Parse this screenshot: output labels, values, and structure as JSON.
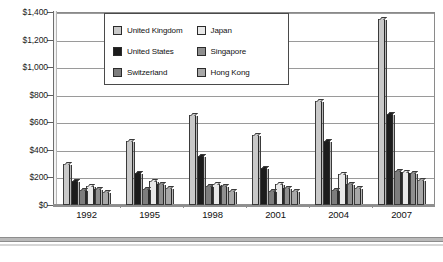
{
  "chart_data": {
    "type": "bar",
    "title": "",
    "xlabel": "",
    "ylabel": "",
    "categories": [
      "1992",
      "1995",
      "1998",
      "2001",
      "2004",
      "2007"
    ],
    "ylim": [
      0,
      1400
    ],
    "ytick_values": [
      0,
      200,
      400,
      600,
      800,
      1000,
      1200,
      1400
    ],
    "ytick_labels": [
      "$0",
      "$200",
      "$400",
      "$600",
      "$800",
      "$1,000",
      "$1,200",
      "$1,400"
    ],
    "grid": true,
    "legend_position": "top-center-overlay",
    "series": [
      {
        "name": "United Kingdom",
        "color": "#c9c9c9",
        "values": [
          300,
          465,
          650,
          505,
          755,
          1350
        ]
      },
      {
        "name": "United States",
        "color": "#1c1c1c",
        "values": [
          175,
          230,
          355,
          265,
          465,
          660
        ]
      },
      {
        "name": "Switzerland",
        "color": "#7d7d7d",
        "values": [
          110,
          115,
          135,
          105,
          110,
          245
        ]
      },
      {
        "name": "Japan",
        "color": "#e8e8e8",
        "values": [
          135,
          175,
          150,
          150,
          225,
          240
        ]
      },
      {
        "name": "Singapore",
        "color": "#8f8f8f",
        "values": [
          115,
          150,
          140,
          125,
          150,
          230
        ]
      },
      {
        "name": "Hong Kong",
        "color": "#a8a8a8",
        "values": [
          95,
          125,
          100,
          100,
          125,
          185
        ]
      }
    ]
  },
  "legend": {
    "items": [
      {
        "label": "United Kingdom"
      },
      {
        "label": "United States"
      },
      {
        "label": "Switzerland"
      },
      {
        "label": "Japan"
      },
      {
        "label": "Singapore"
      },
      {
        "label": "Hong Kong"
      }
    ]
  }
}
